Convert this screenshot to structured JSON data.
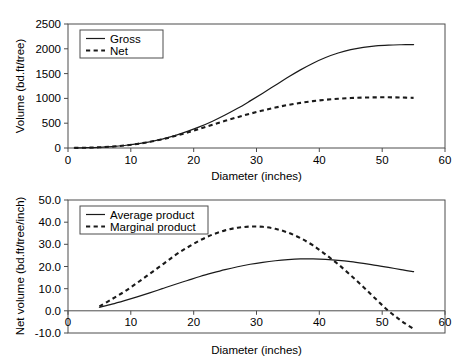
{
  "figure": {
    "background_color": "#ffffff",
    "line_color": "#1a1a1a",
    "axis_color": "#4c4c4c"
  },
  "chart_data": [
    {
      "type": "line",
      "panel": "top",
      "title": "",
      "xlabel": "Diameter (inches)",
      "ylabel": "Volume (bd.ft/tree)",
      "xlim": [
        0,
        60
      ],
      "ylim": [
        0,
        2500
      ],
      "xticks": [
        0,
        10,
        20,
        30,
        40,
        50,
        60
      ],
      "xticklabels": [
        "0",
        "10",
        "20",
        "30",
        "40",
        "50",
        "60"
      ],
      "yticks": [
        0,
        500,
        1000,
        1500,
        2000,
        2500
      ],
      "yticklabels": [
        "0",
        "500",
        "1000",
        "1500",
        "2000",
        "2500"
      ],
      "grid": false,
      "legend_position": "upper left",
      "series": [
        {
          "name": "Gross",
          "style": "solid",
          "x": [
            1,
            3,
            5,
            7,
            9,
            11,
            13,
            15,
            17,
            19,
            21,
            23,
            25,
            27,
            29,
            31,
            33,
            35,
            37,
            39,
            41,
            43,
            45,
            47,
            49,
            51,
            53,
            55
          ],
          "values": [
            2,
            6,
            14,
            28,
            50,
            82,
            125,
            180,
            250,
            335,
            430,
            540,
            665,
            800,
            950,
            1105,
            1265,
            1425,
            1575,
            1710,
            1825,
            1915,
            1985,
            2030,
            2060,
            2075,
            2082,
            2085
          ]
        },
        {
          "name": "Net",
          "style": "dashed",
          "x": [
            1,
            3,
            5,
            7,
            9,
            11,
            13,
            15,
            17,
            19,
            21,
            23,
            25,
            27,
            29,
            31,
            33,
            35,
            37,
            39,
            41,
            43,
            45,
            47,
            49,
            51,
            53,
            55
          ],
          "values": [
            2,
            6,
            14,
            28,
            50,
            82,
            124,
            176,
            240,
            312,
            390,
            470,
            548,
            622,
            692,
            756,
            815,
            868,
            910,
            945,
            972,
            992,
            1007,
            1016,
            1021,
            1022,
            1018,
            1010
          ]
        }
      ]
    },
    {
      "type": "line",
      "panel": "bottom",
      "title": "",
      "xlabel": "Diameter (inches)",
      "ylabel": "Net volume (bd.ft/tree/inch)",
      "xlim": [
        0,
        60
      ],
      "ylim": [
        -10.0,
        50.0
      ],
      "xticks": [
        0,
        10,
        20,
        30,
        40,
        50,
        60
      ],
      "xticklabels": [
        "0",
        "10",
        "20",
        "30",
        "40",
        "50",
        "60"
      ],
      "yticks": [
        -10.0,
        0.0,
        10.0,
        20.0,
        30.0,
        40.0,
        50.0
      ],
      "yticklabels": [
        "-10.0",
        "0.0",
        "10.0",
        "20.0",
        "30.0",
        "40.0",
        "50.0"
      ],
      "grid": false,
      "legend_position": "upper left",
      "series": [
        {
          "name": "Average product",
          "style": "solid",
          "x": [
            5,
            7,
            9,
            11,
            13,
            15,
            17,
            19,
            21,
            23,
            25,
            27,
            29,
            31,
            33,
            35,
            37,
            39,
            41,
            43,
            45,
            47,
            49,
            51,
            53,
            55
          ],
          "values": [
            1.6,
            3.0,
            4.6,
            6.3,
            8.1,
            10.0,
            11.9,
            13.7,
            15.5,
            17.1,
            18.6,
            19.9,
            21.0,
            21.9,
            22.6,
            23.1,
            23.4,
            23.4,
            23.2,
            22.8,
            22.2,
            21.4,
            20.5,
            19.6,
            18.6,
            17.7
          ]
        },
        {
          "name": "Marginal product",
          "style": "dashed",
          "x": [
            5,
            7,
            9,
            11,
            13,
            15,
            17,
            19,
            21,
            23,
            25,
            27,
            29,
            31,
            33,
            35,
            37,
            39,
            41,
            43,
            45,
            47,
            49,
            51,
            53,
            55
          ],
          "values": [
            2.0,
            5.3,
            8.7,
            12.6,
            16.7,
            20.8,
            25.0,
            28.6,
            31.8,
            34.4,
            36.3,
            37.5,
            38.0,
            37.9,
            37.0,
            35.3,
            32.8,
            29.5,
            25.4,
            21.0,
            16.0,
            10.8,
            5.3,
            0.0,
            -4.4,
            -8.2
          ]
        }
      ]
    }
  ]
}
